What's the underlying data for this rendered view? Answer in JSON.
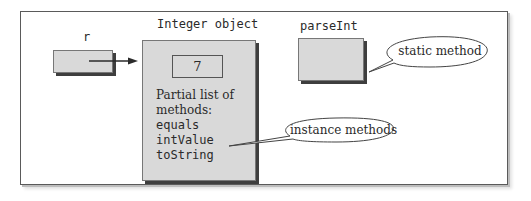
{
  "diagram": {
    "variable": {
      "name": "r"
    },
    "integer_object": {
      "title": "Integer object",
      "value": "7",
      "methods_caption_line1": "Partial list of",
      "methods_caption_line2": "methods:",
      "methods": [
        "equals",
        "intValue",
        "toString"
      ]
    },
    "static_method": {
      "name": "parseInt"
    },
    "callouts": {
      "static": "static method",
      "instance": "instance methods"
    }
  }
}
